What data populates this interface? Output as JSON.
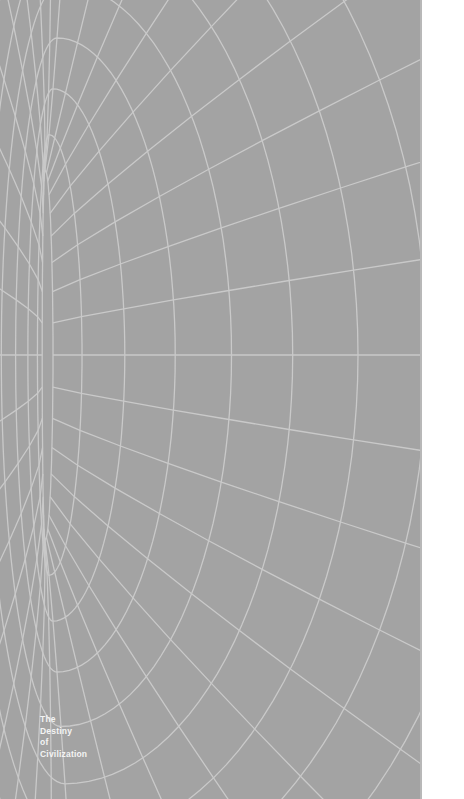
{
  "cover": {
    "background_color": "#a3a3a3",
    "line_color": "#c9c9c9",
    "title_lines": [
      "The",
      "Destiny",
      "of",
      "Civilization"
    ],
    "artwork": "wireframe-tunnel"
  },
  "page": {
    "margin_color": "#ffffff"
  }
}
